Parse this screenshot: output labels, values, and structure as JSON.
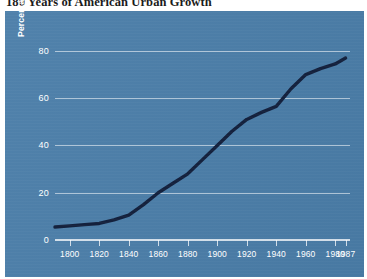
{
  "title": "180 Years of American Urban Growth",
  "colors": {
    "panel_background": "#4a7da8",
    "gridline": "#ffffff",
    "series_line": "#14213d",
    "tick_label": "#ffffff",
    "title_text": "#1b1b1b",
    "page_background": "#ffffff"
  },
  "axes": {
    "y_title": "Percentage of Population Living in an Urban Area",
    "x_title": "",
    "y_ticks": [
      "0",
      "20",
      "40",
      "60",
      "80"
    ],
    "y_tick_values": [
      0,
      20,
      40,
      60,
      80
    ],
    "y_min": 0,
    "y_max": 88,
    "x_ticks": [
      "1800",
      "1820",
      "1840",
      "1860",
      "1880",
      "1900",
      "1920",
      "1940",
      "1960",
      "1980",
      "1987"
    ],
    "x_tick_values": [
      1800,
      1820,
      1840,
      1860,
      1880,
      1900,
      1920,
      1940,
      1960,
      1980,
      1987
    ],
    "x_min": 1790,
    "x_max": 1990,
    "grid": "horizontal"
  },
  "chart_data": {
    "type": "line",
    "title": "180 Years of American Urban Growth",
    "xlabel": "",
    "ylabel": "Percentage of Population Living in an Urban Area",
    "xlim": [
      1790,
      1990
    ],
    "ylim": [
      0,
      88
    ],
    "grid": true,
    "legend": "none",
    "x": [
      1790,
      1800,
      1810,
      1820,
      1830,
      1840,
      1850,
      1860,
      1870,
      1880,
      1890,
      1900,
      1910,
      1920,
      1930,
      1940,
      1950,
      1960,
      1970,
      1980,
      1987
    ],
    "values": [
      5.5,
      6.0,
      6.5,
      7.0,
      8.5,
      10.5,
      15.0,
      20.0,
      24.0,
      28.0,
      34.0,
      40.0,
      46.0,
      51.0,
      54.0,
      56.5,
      64.0,
      70.0,
      72.5,
      74.5,
      77.0
    ],
    "series": [
      {
        "name": "Percentage of Population Living in an Urban Area",
        "values": [
          5.5,
          6.0,
          6.5,
          7.0,
          8.5,
          10.5,
          15.0,
          20.0,
          24.0,
          28.0,
          34.0,
          40.0,
          46.0,
          51.0,
          54.0,
          56.5,
          64.0,
          70.0,
          72.5,
          74.5,
          77.0
        ]
      }
    ]
  }
}
